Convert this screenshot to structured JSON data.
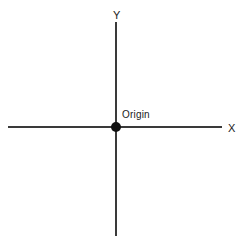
{
  "diagram": {
    "background_color": "#ffffff",
    "axis_color": "#3a3a3a",
    "origin_dot_color": "#111111",
    "text_color": "#1a1a1a",
    "labels": {
      "y_axis": "Y",
      "x_axis": "X",
      "origin": "Origin"
    },
    "geometry": {
      "origin_x": 116,
      "origin_y": 127,
      "y_axis_top": 22,
      "y_axis_bottom": 236,
      "x_axis_left": 8,
      "x_axis_right": 222,
      "origin_dot_diameter": 10,
      "axis_thickness": 2
    }
  }
}
